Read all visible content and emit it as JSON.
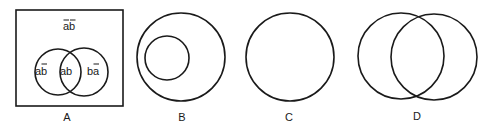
{
  "diagrams": [
    {
      "caption": "A",
      "regions": {
        "outside": "ab",
        "left_only": "ab",
        "intersection": "ab",
        "right_only": "ba"
      },
      "overlines": {
        "outside": "both letters negated (a-bar b-bar)",
        "left_only": "b negated (a b-bar)",
        "right_only": "a negated (b a-bar)"
      }
    },
    {
      "caption": "B",
      "description": "small circle contained inside larger circle"
    },
    {
      "caption": "C",
      "description": "single circle"
    },
    {
      "caption": "D",
      "description": "two largely overlapping circles"
    }
  ]
}
